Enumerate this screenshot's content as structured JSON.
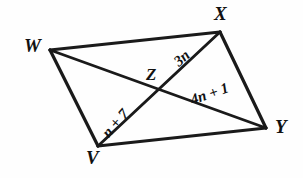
{
  "figure": {
    "stroke_color": "#1a1a1a",
    "background_color": "#fefefe",
    "vertices": [
      {
        "id": "W",
        "label": "W",
        "x": 50,
        "y": 50,
        "label_x": 24,
        "label_y": 36
      },
      {
        "id": "X",
        "label": "X",
        "x": 220,
        "y": 32,
        "label_x": 214,
        "label_y": 4
      },
      {
        "id": "Y",
        "label": "Y",
        "x": 266,
        "y": 128,
        "label_x": 275,
        "label_y": 117
      },
      {
        "id": "V",
        "label": "V",
        "x": 98,
        "y": 146,
        "label_x": 86,
        "label_y": 148
      },
      {
        "id": "Z",
        "label": "Z",
        "x": 163,
        "y": 92,
        "label_x": 146,
        "label_y": 66
      }
    ],
    "sides": [
      {
        "from": "W",
        "to": "X"
      },
      {
        "from": "X",
        "to": "Y"
      },
      {
        "from": "Y",
        "to": "V"
      },
      {
        "from": "V",
        "to": "W"
      }
    ],
    "diagonals": [
      {
        "from": "W",
        "to": "Y"
      },
      {
        "from": "V",
        "to": "X"
      }
    ],
    "segment_labels": [
      {
        "id": "3n",
        "text": "3n",
        "segment": "ZX",
        "x": 176,
        "y": 56,
        "rotation": -41
      },
      {
        "id": "4n1",
        "text": "4n + 1",
        "segment": "ZY",
        "x": 191,
        "y": 93,
        "rotation": -19
      },
      {
        "id": "n7",
        "text": "n + 7",
        "segment": "VZ",
        "x": 105,
        "y": 128,
        "rotation": -49
      }
    ]
  }
}
